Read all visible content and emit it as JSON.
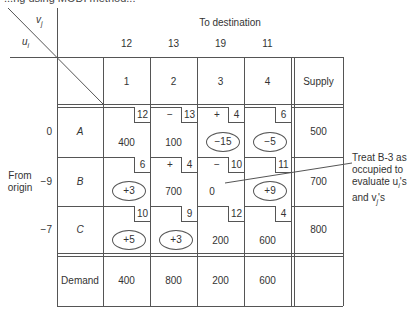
{
  "header": {
    "clipped_title": "...ng using MODI method..."
  },
  "axis_labels": {
    "vj": "v",
    "vj_sub": "j",
    "ui": "u",
    "ui_sub": "i",
    "to_destination": "To destination",
    "from_origin_1": "From",
    "from_origin_2": "origin"
  },
  "vj_values": [
    "12",
    "13",
    "19",
    "11"
  ],
  "columns": [
    "1",
    "2",
    "3",
    "4"
  ],
  "supply_header": "Supply",
  "demand_label": "Demand",
  "rows": [
    {
      "ui": "0",
      "label": "A",
      "supply": "500",
      "cells": [
        {
          "cost": "12",
          "sign": "",
          "value": "400",
          "circled": false
        },
        {
          "cost": "13",
          "sign": "−",
          "value": "100",
          "circled": false
        },
        {
          "cost": "4",
          "sign": "+",
          "value": "−15",
          "circled": true
        },
        {
          "cost": "6",
          "sign": "",
          "value": "−5",
          "circled": true
        }
      ]
    },
    {
      "ui": "−9",
      "label": "B",
      "supply": "700",
      "cells": [
        {
          "cost": "6",
          "sign": "",
          "value": "+3",
          "circled": true
        },
        {
          "cost": "4",
          "sign": "+",
          "value": "700",
          "circled": false
        },
        {
          "cost": "10",
          "sign": "−",
          "value": "0",
          "circled": false
        },
        {
          "cost": "11",
          "sign": "",
          "value": "+9",
          "circled": true
        }
      ]
    },
    {
      "ui": "−7",
      "label": "C",
      "supply": "800",
      "cells": [
        {
          "cost": "10",
          "sign": "",
          "value": "+5",
          "circled": true
        },
        {
          "cost": "9",
          "sign": "",
          "value": "+3",
          "circled": true
        },
        {
          "cost": "12",
          "sign": "",
          "value": "200",
          "circled": false
        },
        {
          "cost": "4",
          "sign": "",
          "value": "600",
          "circled": false
        }
      ]
    }
  ],
  "demand": [
    "400",
    "800",
    "200",
    "600"
  ],
  "annotation": {
    "line1": "Treat B-3 as",
    "line2": "occupied to",
    "line3": "evaluate u",
    "line3_sub": "i",
    "line3_end": "'s",
    "line4": "and v",
    "line4_sub": "j",
    "line4_end": "'s"
  }
}
